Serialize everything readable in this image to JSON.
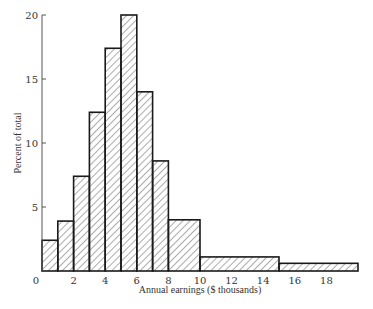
{
  "chart_data": {
    "type": "bar",
    "subtype": "histogram",
    "title": "",
    "xlabel": "Annual earnings ($ thousands)",
    "ylabel": "Percent of total",
    "xlim": [
      0,
      20
    ],
    "ylim": [
      0,
      20
    ],
    "x_ticks": [
      0,
      2,
      4,
      6,
      8,
      10,
      12,
      14,
      16,
      18
    ],
    "y_ticks": [
      5,
      10,
      15,
      20
    ],
    "grid": false,
    "legend": null,
    "bins": [
      {
        "from": 0,
        "to": 1,
        "value": 2.4
      },
      {
        "from": 1,
        "to": 2,
        "value": 3.9
      },
      {
        "from": 2,
        "to": 3,
        "value": 7.4
      },
      {
        "from": 3,
        "to": 4,
        "value": 12.4
      },
      {
        "from": 4,
        "to": 5,
        "value": 17.4
      },
      {
        "from": 5,
        "to": 6,
        "value": 20.0
      },
      {
        "from": 6,
        "to": 7,
        "value": 14.0
      },
      {
        "from": 7,
        "to": 8,
        "value": 8.6
      },
      {
        "from": 8,
        "to": 10,
        "value": 4.0
      },
      {
        "from": 10,
        "to": 15,
        "value": 1.1
      },
      {
        "from": 15,
        "to": 20,
        "value": 0.6
      }
    ],
    "categories": [
      "0-1",
      "1-2",
      "2-3",
      "3-4",
      "4-5",
      "5-6",
      "6-7",
      "7-8",
      "8-10",
      "10-15",
      "15-20"
    ],
    "values": [
      2.4,
      3.9,
      7.4,
      12.4,
      17.4,
      20.0,
      14.0,
      8.6,
      4.0,
      1.1,
      0.6
    ],
    "fill": "diagonal-hatch",
    "colors": {
      "stroke": "#1a1a1a",
      "hatch": "#444444",
      "background": "#ffffff"
    }
  }
}
